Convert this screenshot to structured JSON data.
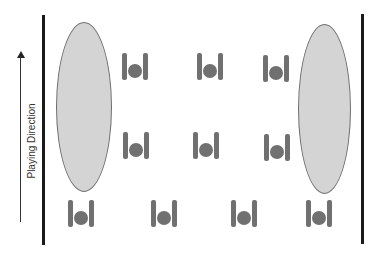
{
  "diagram": {
    "direction_label": "Playing Direction",
    "colors": {
      "boundary": "#1a1a1a",
      "zone_fill": "#d4d4d4",
      "zone_stroke": "#6e6e6e",
      "player": "#707070",
      "arrow": "#333333"
    },
    "boundaries": [
      {
        "side": "left",
        "x": 43,
        "y1": 15,
        "y2": 245
      },
      {
        "side": "right",
        "x": 362,
        "y1": 14,
        "y2": 244
      }
    ],
    "zones": [
      {
        "side": "left",
        "x": 56,
        "y": 22,
        "w": 56,
        "h": 170
      },
      {
        "side": "right",
        "x": 298,
        "y": 24,
        "w": 53,
        "h": 170
      }
    ],
    "players": [
      {
        "row": 1,
        "x": 122,
        "y": 53
      },
      {
        "row": 1,
        "x": 197,
        "y": 53
      },
      {
        "row": 1,
        "x": 263,
        "y": 55
      },
      {
        "row": 2,
        "x": 123,
        "y": 132
      },
      {
        "row": 2,
        "x": 193,
        "y": 132
      },
      {
        "row": 2,
        "x": 264,
        "y": 134
      },
      {
        "row": 3,
        "x": 68,
        "y": 200
      },
      {
        "row": 3,
        "x": 151,
        "y": 200
      },
      {
        "row": 3,
        "x": 231,
        "y": 200
      },
      {
        "row": 3,
        "x": 306,
        "y": 200
      }
    ]
  }
}
